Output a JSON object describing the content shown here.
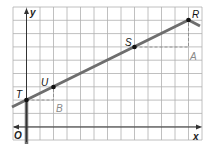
{
  "diagram": {
    "type": "coordinate-graph",
    "axes": {
      "x_label": "x",
      "y_label": "y",
      "origin_label": "O"
    },
    "grid": {
      "x_min": -1,
      "x_max": 13,
      "y_min": -1,
      "y_max": 9
    },
    "points": [
      {
        "label": "T",
        "x": 0,
        "y": 2
      },
      {
        "label": "U",
        "x": 2,
        "y": 3
      },
      {
        "label": "S",
        "x": 8,
        "y": 6
      },
      {
        "label": "R",
        "x": 12,
        "y": 8
      }
    ],
    "helper_points": [
      {
        "label": "A",
        "x": 12,
        "y": 6
      },
      {
        "label": "B",
        "x": 2,
        "y": 2
      }
    ],
    "colors": {
      "grid": "#b0b0b0",
      "line": "#6e6e6e",
      "axis": "#333333",
      "points": "#111111",
      "helper_label": "#8a8a8a",
      "dashed": "#8a8a8a"
    }
  }
}
